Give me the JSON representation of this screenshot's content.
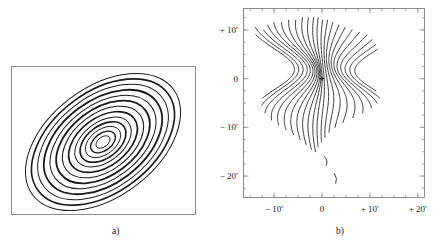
{
  "figure": {
    "background": "#ffffff",
    "line_color": "#1a1a1a",
    "frame_color": "#8c8c8c"
  },
  "panels": [
    {
      "id": "a",
      "caption": "a)",
      "axes_shown": false
    },
    {
      "id": "b",
      "caption": "b)",
      "axes_shown": true
    }
  ],
  "axes": {
    "b": {
      "x_ticks": [
        {
          "label": "− 10′",
          "value": -10
        },
        {
          "label": "0",
          "value": 0
        },
        {
          "label": "+ 10′",
          "value": 10
        },
        {
          "label": "+ 20′",
          "value": 20
        }
      ],
      "y_ticks": [
        {
          "label": "+ 10′",
          "value": 10
        },
        {
          "label": "0",
          "value": 0
        },
        {
          "label": "− 10′",
          "value": -10
        },
        {
          "label": "− 20′",
          "value": -20
        }
      ],
      "x_minor_step": 2.5,
      "y_minor_step": 2.5,
      "xlim": [
        -16.5,
        21.5
      ],
      "ylim": [
        -24.5,
        14.5
      ],
      "unit": "arcmin"
    }
  },
  "chart_data": [
    {
      "type": "line",
      "id": "panel-a",
      "title": "",
      "xlabel": "",
      "ylabel": "",
      "description": "Nested concentric elliptical contours, position angle tilted counter-clockwise, alternating heavy and light line weights",
      "grid": false,
      "legend": null,
      "xlim": [
        0,
        185
      ],
      "ylim": [
        0,
        149
      ],
      "center": [
        92,
        76
      ],
      "tilt_deg": -37,
      "axis_ratio": 0.62,
      "contours": [
        {
          "index": 1,
          "semi_major": 8,
          "weight": 0.9
        },
        {
          "index": 2,
          "semi_major": 14,
          "weight": 1.4
        },
        {
          "index": 3,
          "semi_major": 20,
          "weight": 0.9
        },
        {
          "index": 4,
          "semi_major": 26,
          "weight": 1.6
        },
        {
          "index": 5,
          "semi_major": 32,
          "weight": 1.0
        },
        {
          "index": 6,
          "semi_major": 39,
          "weight": 1.7
        },
        {
          "index": 7,
          "semi_major": 46,
          "weight": 1.0
        },
        {
          "index": 8,
          "semi_major": 53,
          "weight": 1.8
        },
        {
          "index": 9,
          "semi_major": 60,
          "weight": 1.0
        },
        {
          "index": 10,
          "semi_major": 67,
          "weight": 1.8
        },
        {
          "index": 11,
          "semi_major": 74,
          "weight": 1.0
        },
        {
          "index": 12,
          "semi_major": 81,
          "weight": 1.6
        },
        {
          "index": 13,
          "semi_major": 88,
          "weight": 1.0
        }
      ]
    },
    {
      "type": "line",
      "id": "panel-b",
      "title": "",
      "xlabel": "",
      "ylabel": "",
      "description": "Field of wavy, quasi-vertical contour lines converging toward a pinch near the origin; isolated short arcs below -15 arcmin",
      "grid": false,
      "legend": null,
      "xlim": [
        -16.5,
        21.5
      ],
      "ylim": [
        -24.5,
        14.5
      ],
      "origin_marker": {
        "x": 0,
        "y": 0,
        "shape": "cross"
      },
      "curves": [
        {
          "index": 1,
          "x_offset": -14.5,
          "amp": 2.2,
          "phase": 0.25,
          "y_top": 9.0,
          "y_bottom": -4.0
        },
        {
          "index": 2,
          "x_offset": -13.0,
          "amp": 2.4,
          "phase": 0.4,
          "y_top": 10.5,
          "y_bottom": -5.5
        },
        {
          "index": 3,
          "x_offset": -11.4,
          "amp": 2.6,
          "phase": 0.55,
          "y_top": 10.0,
          "y_bottom": -7.0
        },
        {
          "index": 4,
          "x_offset": -9.8,
          "amp": 2.7,
          "phase": 0.7,
          "y_top": 11.0,
          "y_bottom": -8.5
        },
        {
          "index": 5,
          "x_offset": -8.4,
          "amp": 2.6,
          "phase": 0.85,
          "y_top": 11.5,
          "y_bottom": -9.5
        },
        {
          "index": 6,
          "x_offset": -7.0,
          "amp": 2.4,
          "phase": 1.0,
          "y_top": 11.5,
          "y_bottom": -10.5
        },
        {
          "index": 7,
          "x_offset": -5.7,
          "amp": 2.1,
          "phase": 1.15,
          "y_top": 12.0,
          "y_bottom": -11.5
        },
        {
          "index": 8,
          "x_offset": -4.5,
          "amp": 1.8,
          "phase": 1.3,
          "y_top": 12.0,
          "y_bottom": -12.5
        },
        {
          "index": 9,
          "x_offset": -3.4,
          "amp": 1.5,
          "phase": 1.45,
          "y_top": 12.5,
          "y_bottom": -13.5
        },
        {
          "index": 10,
          "x_offset": -2.4,
          "amp": 1.2,
          "phase": 1.6,
          "y_top": 12.5,
          "y_bottom": -14.5
        },
        {
          "index": 11,
          "x_offset": -1.5,
          "amp": 0.9,
          "phase": 1.75,
          "y_top": 12.5,
          "y_bottom": -15.0
        },
        {
          "index": 12,
          "x_offset": -0.7,
          "amp": 0.7,
          "phase": 1.9,
          "y_top": 12.5,
          "y_bottom": -14.0
        },
        {
          "index": 13,
          "x_offset": 0.2,
          "amp": 0.7,
          "phase": 2.05,
          "y_top": 12.0,
          "y_bottom": -13.0
        },
        {
          "index": 14,
          "x_offset": 1.2,
          "amp": 1.0,
          "phase": 2.2,
          "y_top": 12.0,
          "y_bottom": -12.0
        },
        {
          "index": 15,
          "x_offset": 2.3,
          "amp": 1.4,
          "phase": 2.35,
          "y_top": 11.5,
          "y_bottom": -11.0
        },
        {
          "index": 16,
          "x_offset": 3.6,
          "amp": 1.8,
          "phase": 2.5,
          "y_top": 11.0,
          "y_bottom": -10.0
        },
        {
          "index": 17,
          "x_offset": 5.0,
          "amp": 2.2,
          "phase": 2.65,
          "y_top": 10.5,
          "y_bottom": -9.0
        },
        {
          "index": 18,
          "x_offset": 6.6,
          "amp": 2.5,
          "phase": 2.8,
          "y_top": 10.0,
          "y_bottom": -8.0
        },
        {
          "index": 19,
          "x_offset": 8.3,
          "amp": 2.6,
          "phase": 2.95,
          "y_top": 9.5,
          "y_bottom": -7.0
        },
        {
          "index": 20,
          "x_offset": 10.2,
          "amp": 2.5,
          "phase": 3.1,
          "y_top": 9.0,
          "y_bottom": -6.0
        },
        {
          "index": 21,
          "x_offset": 12.2,
          "amp": 2.2,
          "phase": 3.25,
          "y_top": 8.0,
          "y_bottom": -5.0
        },
        {
          "index": 22,
          "x_offset": 14.3,
          "amp": 1.8,
          "phase": 3.4,
          "y_top": 7.0,
          "y_bottom": -4.0
        },
        {
          "index": 23,
          "x_offset": 16.4,
          "amp": 1.4,
          "phase": 3.55,
          "y_top": 6.0,
          "y_bottom": -2.5
        }
      ],
      "fragments": [
        {
          "index": 1,
          "x": 0.5,
          "y_top": -16.0,
          "y_bottom": -17.8,
          "bow": 0.9
        },
        {
          "index": 2,
          "x": 2.6,
          "y_top": -19.5,
          "y_bottom": -21.5,
          "bow": 0.7
        }
      ]
    }
  ]
}
